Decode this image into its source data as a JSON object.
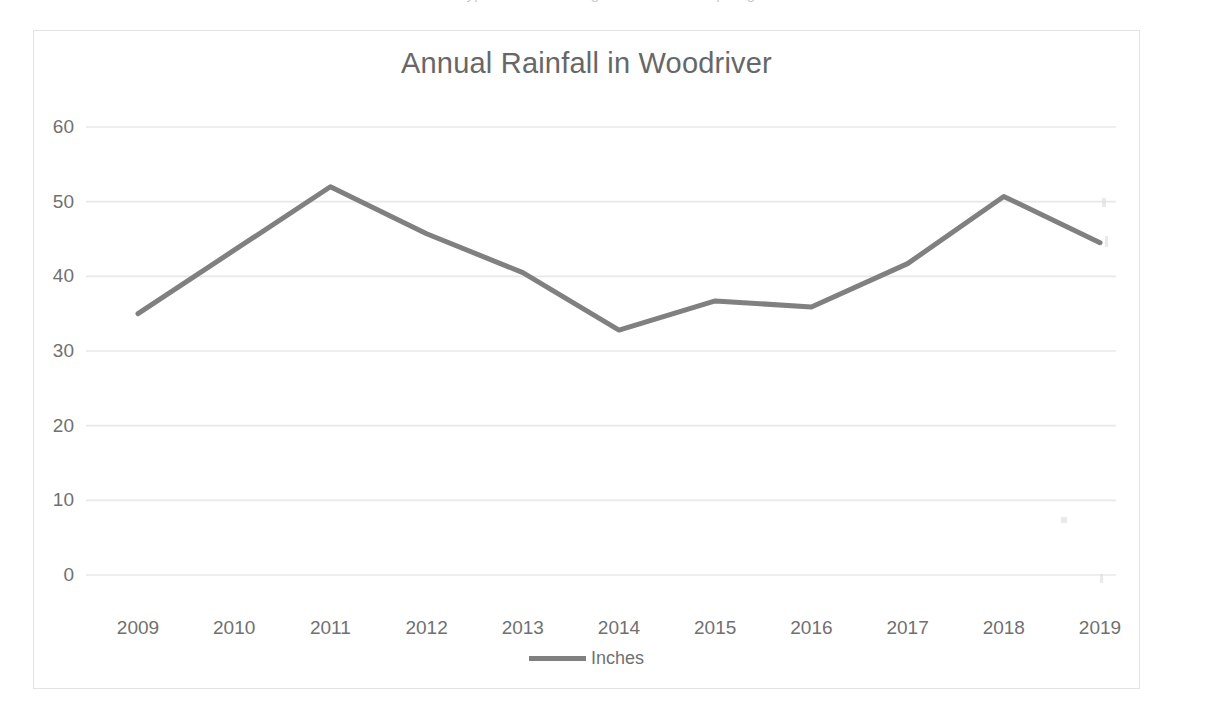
{
  "page": {
    "background": "#ffffff",
    "top_cropped_text": "typed sentence fragment cut off at top edge"
  },
  "chart_frame": {
    "border_color": "#e3e3e5",
    "background": "#ffffff"
  },
  "legend": {
    "position": "bottom-center",
    "entries": [
      {
        "label": "Inches",
        "color": "#808080",
        "marker": "line"
      }
    ]
  },
  "chart_data": {
    "type": "line",
    "title": "Annual Rainfall in Woodriver",
    "xlabel": "",
    "ylabel": "",
    "categories": [
      "2009",
      "2010",
      "2011",
      "2012",
      "2013",
      "2014",
      "2015",
      "2016",
      "2017",
      "2018",
      "2019"
    ],
    "series": [
      {
        "name": "Inches",
        "color": "#808080",
        "values": [
          35.0,
          43.5,
          52.0,
          45.7,
          40.5,
          32.8,
          36.7,
          35.9,
          41.7,
          50.7,
          44.5
        ]
      }
    ],
    "ylim": [
      0,
      60
    ],
    "ytick_step": 10,
    "yticks": [
      "0",
      "10",
      "20",
      "30",
      "40",
      "50",
      "60"
    ],
    "grid": true,
    "grid_color": "#e8e8ea",
    "legend_position": "bottom",
    "line_width": 5
  }
}
